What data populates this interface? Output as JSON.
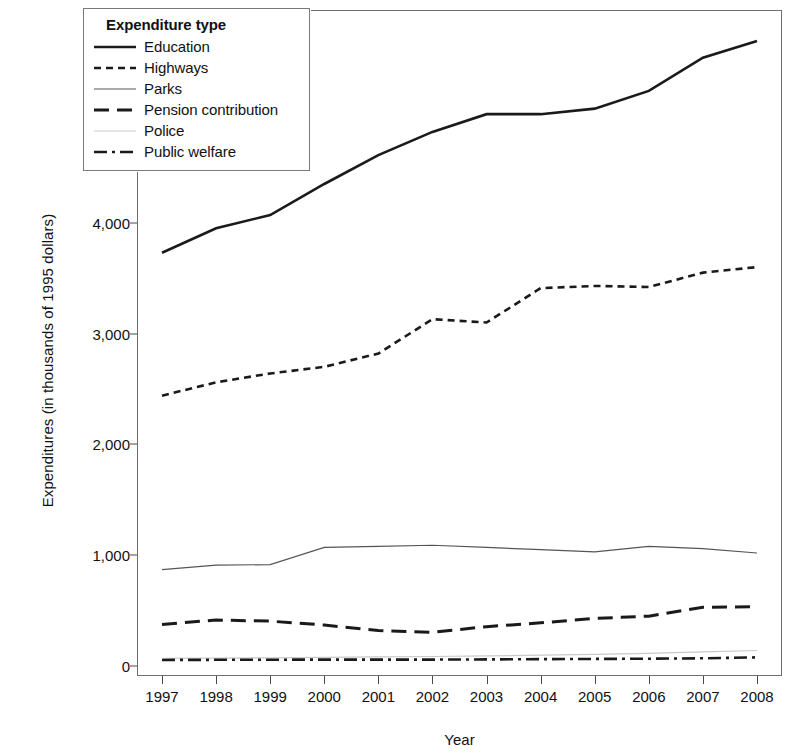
{
  "chart_data": {
    "type": "line",
    "title": "",
    "xlabel": "Year",
    "ylabel": "Expenditures (in thousands of 1995 dollars)",
    "x": [
      1997,
      1998,
      1999,
      2000,
      2001,
      2002,
      2003,
      2004,
      2005,
      2006,
      2007,
      2008
    ],
    "xtick_labels": [
      "1997",
      "1998",
      "1999",
      "2000",
      "2001",
      "2002",
      "2003",
      "2004",
      "2005",
      "2006",
      "2007",
      "2008"
    ],
    "ytick_labels": [
      "0",
      "1,000",
      "2,000",
      "3,000",
      "4,000",
      "5,000"
    ],
    "ytick_values": [
      0,
      1000,
      2000,
      3000,
      4000,
      5000
    ],
    "xlim": [
      1997,
      2008
    ],
    "ylim": [
      -90,
      5920
    ],
    "grid": false,
    "legend_position": "top-left",
    "legend_title": "Expenditure type",
    "series": [
      {
        "name": "Education",
        "style": "solid",
        "color": "#1a1a1a",
        "values": [
          3730,
          3950,
          4070,
          4350,
          4610,
          4820,
          4980,
          4980,
          5030,
          5190,
          5490,
          5640
        ]
      },
      {
        "name": "Highways",
        "style": "dotted",
        "color": "#1a1a1a",
        "values": [
          2440,
          2560,
          2640,
          2700,
          2820,
          3130,
          3100,
          3410,
          3430,
          3420,
          3550,
          3600
        ]
      },
      {
        "name": "Parks",
        "style": "solid-thin",
        "color": "#555555",
        "values": [
          870,
          910,
          915,
          1070,
          1080,
          1090,
          1070,
          1050,
          1030,
          1080,
          1060,
          1020
        ]
      },
      {
        "name": "Pension contribution",
        "style": "dashed",
        "color": "#1a1a1a",
        "values": [
          375,
          415,
          405,
          370,
          320,
          305,
          355,
          390,
          430,
          450,
          530,
          535
        ]
      },
      {
        "name": "Police",
        "style": "solid-light",
        "color": "#c9c9c9",
        "values": [
          70,
          72,
          74,
          78,
          82,
          86,
          92,
          98,
          105,
          115,
          128,
          140
        ]
      },
      {
        "name": "Public welfare",
        "style": "dash-dot",
        "color": "#1a1a1a",
        "values": [
          55,
          56,
          57,
          58,
          58,
          58,
          60,
          62,
          64,
          66,
          70,
          78
        ]
      }
    ]
  },
  "legend": {
    "title": "Expenditure type",
    "items": [
      {
        "label": "Education",
        "swatch": "line-solid-icon"
      },
      {
        "label": "Highways",
        "swatch": "line-dotted-icon"
      },
      {
        "label": "Parks",
        "swatch": "line-thin-icon"
      },
      {
        "label": "Pension contribution",
        "swatch": "line-dashed-icon"
      },
      {
        "label": "Police",
        "swatch": "line-light-icon"
      },
      {
        "label": "Public welfare",
        "swatch": "line-dashdot-icon"
      }
    ]
  },
  "axes": {
    "y_title": "Expenditures (in thousands of 1995 dollars)",
    "x_title": "Year"
  }
}
